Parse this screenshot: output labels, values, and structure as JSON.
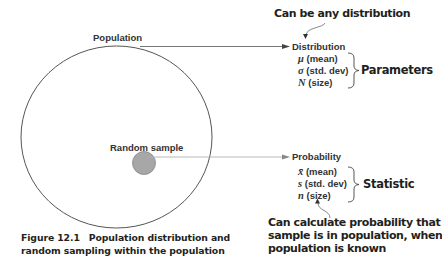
{
  "diagram": {
    "population_label": "Population",
    "sample_label": "Random sample",
    "distribution": {
      "title": "Distribution",
      "items": [
        {
          "symbol": "μ",
          "text": " (mean)"
        },
        {
          "symbol": "σ",
          "text": " (std. dev)"
        },
        {
          "symbol": "N",
          "text": " (size)"
        }
      ],
      "group_label": "Parameters",
      "callout": "Can be any distribution"
    },
    "probability": {
      "title": "Probability",
      "items": [
        {
          "symbol": "x̄",
          "text": " (mean)"
        },
        {
          "symbol": "s",
          "text": " (std. dev)"
        },
        {
          "symbol": "n",
          "text": " (size)"
        }
      ],
      "group_label": "Statistic",
      "callout_lines": [
        "Can calculate probability that",
        "sample is in population, when",
        "population is known"
      ]
    },
    "colors": {
      "circle_stroke": "#555555",
      "sample_fill": "#a7a7a7",
      "arrow": "#666666",
      "text": "#231f20"
    }
  },
  "caption": {
    "number": "Figure 12.1",
    "lines": [
      "Population distribution and",
      "random sampling within the population"
    ]
  }
}
